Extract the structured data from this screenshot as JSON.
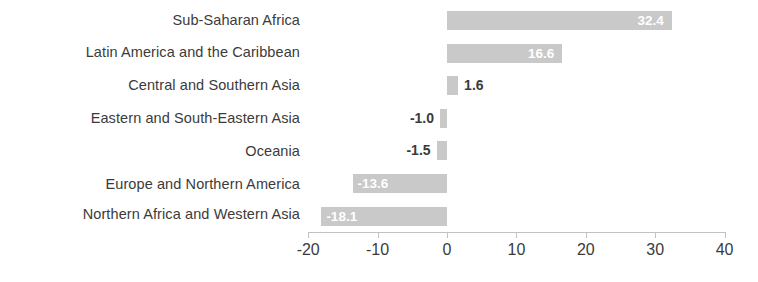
{
  "chart_data": {
    "type": "bar",
    "orientation": "horizontal",
    "title": "",
    "subtitle": "",
    "xlabel": "",
    "ylabel": "",
    "categories": [
      "Sub-Saharan Africa",
      "Latin America and the Caribbean",
      "Central and Southern Asia",
      "Eastern and South-Eastern Asia",
      "Oceania",
      "Europe and Northern America",
      "Northern Africa and Western Asia"
    ],
    "values": [
      32.4,
      16.6,
      1.6,
      -1.0,
      -1.5,
      -13.6,
      -18.1
    ],
    "value_labels": [
      "32.4",
      "16.6",
      "1.6",
      "-1.0",
      "-1.5",
      "-13.6",
      "-18.1"
    ],
    "xlim": [
      -20,
      40
    ],
    "xticks": [
      -20,
      -10,
      0,
      10,
      20,
      30,
      40
    ],
    "xtick_labels": [
      "-20",
      "-10",
      "0",
      "10",
      "20",
      "30",
      "40"
    ],
    "grid": false,
    "legend": "none",
    "bar_color": "#c9c9c9",
    "label_inside_color": "#ffffff",
    "label_outside_color": "#3b3b3b",
    "axis_color": "#c2c2c2",
    "text_color": "#3b3b3b",
    "background": "#ffffff"
  }
}
